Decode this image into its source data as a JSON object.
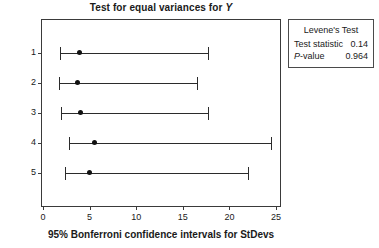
{
  "chart_data": {
    "type": "bar",
    "subtype": "confidence-interval-plot",
    "title": "Test for equal variances for Y",
    "title_prefix": "Test for equal variances for",
    "title_variable": "Y",
    "xlabel": "95% Bonferroni confidence intervals for StDevs",
    "ylabel": "Treatment",
    "xlim": [
      0,
      25
    ],
    "xticks": [
      0,
      5,
      10,
      15,
      20,
      25
    ],
    "xtick_labels": [
      "0",
      "5",
      "10",
      "15",
      "20",
      "25"
    ],
    "categories": [
      "1",
      "2",
      "3",
      "4",
      "5"
    ],
    "grid": false,
    "legend_position": "right-outside",
    "series": [
      {
        "name": "95% Bonferroni CI for StDev",
        "points": [
          {
            "category": "1",
            "estimate": 3.9,
            "lower": 1.8,
            "upper": 17.7
          },
          {
            "category": "2",
            "estimate": 3.7,
            "lower": 1.7,
            "upper": 16.5
          },
          {
            "category": "3",
            "estimate": 4.0,
            "lower": 1.9,
            "upper": 17.7
          },
          {
            "category": "4",
            "estimate": 5.5,
            "lower": 2.8,
            "upper": 24.5
          },
          {
            "category": "5",
            "estimate": 5.0,
            "lower": 2.4,
            "upper": 22.0
          }
        ]
      }
    ],
    "annotations": {
      "test_name": "Levene's Test",
      "test_statistic_label": "Test statistic",
      "test_statistic_value": "0.14",
      "p_value_label": "P-value",
      "p_value_label_italic_prefix": "P",
      "p_value_label_suffix": "-value",
      "p_value": "0.964"
    }
  },
  "colors": {
    "line": "#2b2b2b",
    "point": "#111111",
    "frame": "#3a3a3a",
    "text": "#1a1a1a",
    "background": "#ffffff"
  }
}
